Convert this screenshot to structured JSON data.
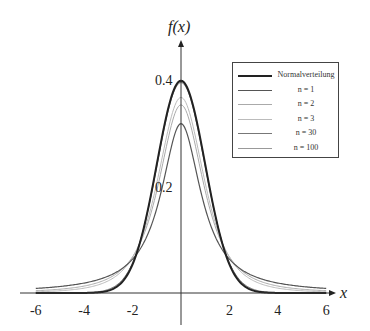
{
  "chart_data": {
    "type": "line",
    "title": "",
    "xlabel": "x",
    "ylabel": "f(x)",
    "xlim": [
      -6,
      6
    ],
    "ylim": [
      0,
      0.42
    ],
    "x_ticks": [
      "-6",
      "-4",
      "-2",
      "2",
      "4",
      "6"
    ],
    "y_ticks": [
      "0.2",
      "0.4"
    ],
    "grid": false,
    "legend_position": "upper right",
    "series": [
      {
        "name": "Normalverteilung",
        "distribution": "normal",
        "peak": 0.399,
        "color": "#222222",
        "width": 2
      },
      {
        "name": "n = 1",
        "distribution": "t",
        "df": 1,
        "peak": 0.318,
        "color": "#555555",
        "width": 1.2
      },
      {
        "name": "n = 2",
        "distribution": "t",
        "df": 2,
        "peak": 0.354,
        "color": "#aaaaaa",
        "width": 1
      },
      {
        "name": "n = 3",
        "distribution": "t",
        "df": 3,
        "peak": 0.368,
        "color": "#bbbbbb",
        "width": 1
      },
      {
        "name": "n = 30",
        "distribution": "t",
        "df": 30,
        "peak": 0.396,
        "color": "#777777",
        "width": 1
      },
      {
        "name": "n = 100",
        "distribution": "t",
        "df": 100,
        "peak": 0.398,
        "color": "#999999",
        "width": 1
      }
    ]
  },
  "axis": {
    "x_label": "x",
    "y_label": "f(x)"
  },
  "legend": {
    "items": [
      {
        "label": "Normalverteilung"
      },
      {
        "label": "n = 1"
      },
      {
        "label": "n = 2"
      },
      {
        "label": "n = 3"
      },
      {
        "label": "n = 30"
      },
      {
        "label": "n = 100"
      }
    ]
  }
}
